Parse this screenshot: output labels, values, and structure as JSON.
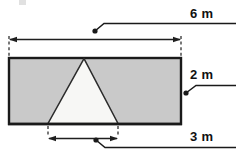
{
  "diagram": {
    "type": "geometry-dimension-drawing",
    "background_color": "#ffffff",
    "shapes": {
      "rectangle": {
        "name": "shaded-rectangle",
        "fill_color": "#c9c9c9",
        "stroke_color": "#1a1a1a",
        "stroke_width": 2,
        "x": 8,
        "y": 57,
        "width": 174,
        "height": 68,
        "width_label": "6 m",
        "height_label": "2 m"
      },
      "triangle": {
        "name": "inscribed-triangle",
        "fill_color": "#f7f7f5",
        "stroke_color": "#2b2b2b",
        "stroke_width": 1.4,
        "apex_x": 84,
        "apex_y": 57,
        "base_left_x": 48,
        "base_right_x": 118,
        "base_y": 125,
        "base_label": "3 m"
      }
    },
    "dimensions": [
      {
        "id": "top-width",
        "label": "6 m",
        "value": 6,
        "unit": "m",
        "orientation": "horizontal",
        "line_y": 39,
        "from_x": 9,
        "to_x": 181,
        "measures": "rectangle width"
      },
      {
        "id": "right-height",
        "label": "2 m",
        "value": 2,
        "unit": "m",
        "orientation": "vertical",
        "measures": "rectangle height"
      },
      {
        "id": "bottom-base",
        "label": "3 m",
        "value": 3,
        "unit": "m",
        "orientation": "horizontal",
        "line_y": 138,
        "from_x": 48,
        "to_x": 118,
        "measures": "triangle base"
      }
    ],
    "leaders": [
      {
        "id": "leader-6m",
        "dot_x": 95,
        "dot_y": 31,
        "label": "6 m"
      },
      {
        "id": "leader-2m",
        "dot_x": 186,
        "dot_y": 93,
        "label": "2 m"
      },
      {
        "id": "leader-3m",
        "dot_x": 96,
        "dot_y": 140,
        "label": "3 m"
      }
    ],
    "labels": {
      "top": "6 m",
      "right": "2 m",
      "bottom": "3 m"
    },
    "colors": {
      "shaded_fill": "#c9c9c9",
      "unshaded_fill": "#f7f7f5",
      "outline": "#1a1a1a",
      "dimension_line": "#1f1f1f",
      "text": "#111111"
    }
  }
}
